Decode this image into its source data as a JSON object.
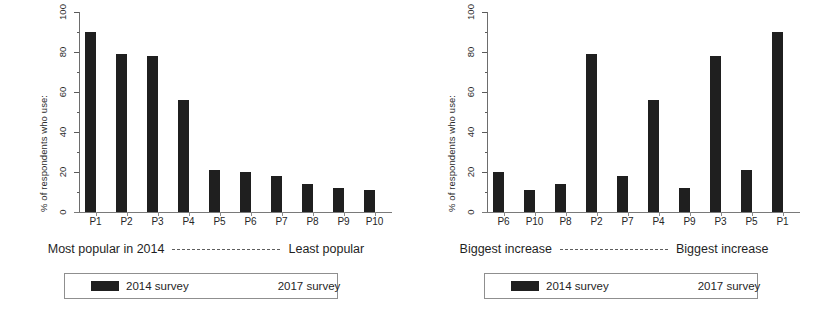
{
  "chart_data": [
    {
      "type": "bar",
      "panel_id": "left",
      "title": "",
      "xlabel": "",
      "ylabel": "% of respondents who use:",
      "ylim": [
        0,
        100
      ],
      "yticks": [
        0,
        20,
        40,
        60,
        80,
        100
      ],
      "ytick_labels": [
        "0",
        "20",
        "40",
        "60",
        "80",
        "100"
      ],
      "y_minor_step": 10,
      "grid": false,
      "categories": [
        "P1",
        "P2",
        "P3",
        "P4",
        "P5",
        "P6",
        "P7",
        "P8",
        "P9",
        "P10"
      ],
      "series": [
        {
          "name": "2014 survey",
          "color": "#1f1f1f",
          "values": [
            90,
            79,
            78,
            56,
            21,
            20,
            18,
            14,
            12,
            11
          ]
        },
        {
          "name": "2017 survey",
          "color": "#ffffff",
          "values": [
            0,
            0,
            0,
            0,
            0,
            0,
            0,
            0,
            0,
            0
          ]
        }
      ],
      "caption_left": "Most popular in 2014",
      "caption_right": "Least popular",
      "legend_position": "below",
      "legend_entries": [
        "2014 survey",
        "2017 survey"
      ]
    },
    {
      "type": "bar",
      "panel_id": "right",
      "title": "",
      "xlabel": "",
      "ylabel": "% of respondents who use:",
      "ylim": [
        0,
        100
      ],
      "yticks": [
        0,
        20,
        40,
        60,
        80,
        100
      ],
      "ytick_labels": [
        "0",
        "20",
        "40",
        "60",
        "80",
        "100"
      ],
      "y_minor_step": 10,
      "grid": false,
      "categories": [
        "P6",
        "P10",
        "P8",
        "P2",
        "P7",
        "P4",
        "P9",
        "P3",
        "P5",
        "P1"
      ],
      "series": [
        {
          "name": "2014 survey",
          "color": "#1f1f1f",
          "values": [
            20,
            11,
            14,
            79,
            18,
            56,
            12,
            78,
            21,
            90
          ]
        },
        {
          "name": "2017 survey",
          "color": "#ffffff",
          "values": [
            0,
            0,
            0,
            0,
            0,
            0,
            0,
            0,
            0,
            0
          ]
        }
      ],
      "caption_left": "Biggest increase",
      "caption_right": "Biggest increase",
      "legend_position": "below",
      "legend_entries": [
        "2014 survey",
        "2017 survey"
      ]
    }
  ],
  "left": {
    "ylabel": "% of respondents who use:",
    "ytick_labels": [
      "100",
      "80",
      "60",
      "40",
      "20",
      "0"
    ],
    "xlabels": [
      "P1",
      "P2",
      "P3",
      "P4",
      "P5",
      "P6",
      "P7",
      "P8",
      "P9",
      "P10"
    ],
    "caption_left": "Most popular in 2014",
    "caption_right": "Least popular",
    "legend": {
      "entry1": "2014 survey",
      "entry2": "2017 survey"
    }
  },
  "right": {
    "ylabel": "% of respondents who use:",
    "ytick_labels": [
      "100",
      "80",
      "60",
      "40",
      "20",
      "0"
    ],
    "xlabels": [
      "P6",
      "P10",
      "P8",
      "P2",
      "P7",
      "P4",
      "P9",
      "P3",
      "P5",
      "P1"
    ],
    "caption_left": "Biggest increase",
    "caption_right": "Biggest increase",
    "legend": {
      "entry1": "2014 survey",
      "entry2": "2017 survey"
    }
  },
  "colors": {
    "bar_2014": "#1f1f1f",
    "bar_2017": "#ffffff",
    "axis": "#6d6d6d",
    "text": "#1f1f1f",
    "background": "#ffffff"
  }
}
